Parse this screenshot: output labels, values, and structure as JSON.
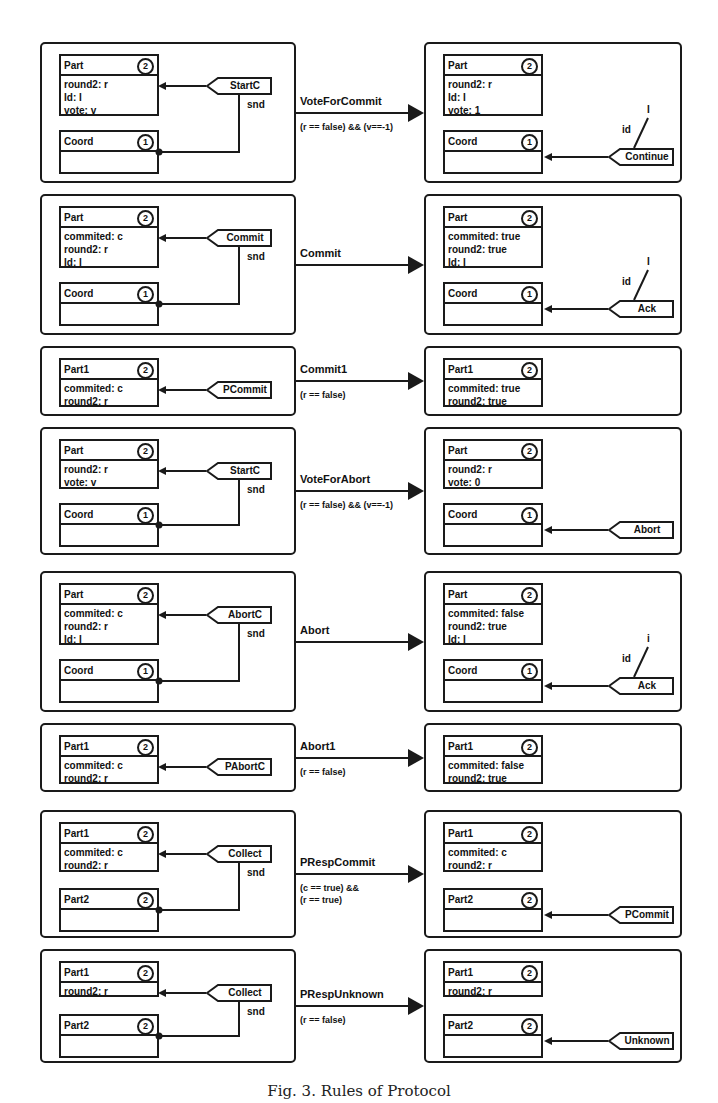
{
  "rules": [
    {
      "name": "VoteForCommit",
      "condition": [
        "(r == false) && (v==-1)"
      ],
      "lhs": {
        "nodes": [
          {
            "type": "Part",
            "mult": "2",
            "attrs": [
              "round2: r",
              "Id: I",
              "vote: v"
            ]
          },
          {
            "type": "Coord",
            "mult": "1",
            "attrs": []
          }
        ],
        "message": "StartC",
        "edge_label": "snd"
      },
      "rhs": {
        "nodes": [
          {
            "type": "Part",
            "mult": "2",
            "attrs": [
              "round2: r",
              "Id: I",
              "vote: 1"
            ]
          },
          {
            "type": "Coord",
            "mult": "1",
            "attrs": []
          }
        ],
        "message": "Continue",
        "param_label": "id",
        "param_value": "I"
      }
    },
    {
      "name": "Commit",
      "condition": [],
      "lhs": {
        "nodes": [
          {
            "type": "Part",
            "mult": "2",
            "attrs": [
              "commited: c",
              "round2: r",
              "Id: I"
            ]
          },
          {
            "type": "Coord",
            "mult": "1",
            "attrs": []
          }
        ],
        "message": "Commit",
        "edge_label": "snd"
      },
      "rhs": {
        "nodes": [
          {
            "type": "Part",
            "mult": "2",
            "attrs": [
              "commited: true",
              "round2: true",
              "Id: I"
            ]
          },
          {
            "type": "Coord",
            "mult": "1",
            "attrs": []
          }
        ],
        "message": "Ack",
        "param_label": "id",
        "param_value": "I"
      }
    },
    {
      "name": "Commit1",
      "condition": [
        "(r == false)"
      ],
      "lhs": {
        "nodes": [
          {
            "type": "Part1",
            "mult": "2",
            "attrs": [
              "commited: c",
              "round2: r"
            ]
          }
        ],
        "message": "PCommit"
      },
      "rhs": {
        "nodes": [
          {
            "type": "Part1",
            "mult": "2",
            "attrs": [
              "commited: true",
              "round2: true"
            ]
          }
        ]
      }
    },
    {
      "name": "VoteForAbort",
      "condition": [
        "(r == false) && (v==-1)"
      ],
      "lhs": {
        "nodes": [
          {
            "type": "Part",
            "mult": "2",
            "attrs": [
              "round2: r",
              "vote: v"
            ]
          },
          {
            "type": "Coord",
            "mult": "1",
            "attrs": []
          }
        ],
        "message": "StartC",
        "edge_label": "snd"
      },
      "rhs": {
        "nodes": [
          {
            "type": "Part",
            "mult": "2",
            "attrs": [
              "round2: r",
              "vote: 0"
            ]
          },
          {
            "type": "Coord",
            "mult": "1",
            "attrs": []
          }
        ],
        "message": "Abort"
      }
    },
    {
      "name": "Abort",
      "condition": [],
      "lhs": {
        "nodes": [
          {
            "type": "Part",
            "mult": "2",
            "attrs": [
              "commited: c",
              "round2: r",
              "Id: I"
            ]
          },
          {
            "type": "Coord",
            "mult": "1",
            "attrs": []
          }
        ],
        "message": "AbortC",
        "edge_label": "snd"
      },
      "rhs": {
        "nodes": [
          {
            "type": "Part",
            "mult": "2",
            "attrs": [
              "commited: false",
              "round2: true",
              "Id: I"
            ]
          },
          {
            "type": "Coord",
            "mult": "1",
            "attrs": []
          }
        ],
        "message": "Ack",
        "param_label": "id",
        "param_value": "i"
      }
    },
    {
      "name": "Abort1",
      "condition": [
        "(r == false)"
      ],
      "lhs": {
        "nodes": [
          {
            "type": "Part1",
            "mult": "2",
            "attrs": [
              "commited: c",
              "round2: r"
            ]
          }
        ],
        "message": "PAbortC"
      },
      "rhs": {
        "nodes": [
          {
            "type": "Part1",
            "mult": "2",
            "attrs": [
              "commited: false",
              "round2: true"
            ]
          }
        ]
      }
    },
    {
      "name": "PRespCommit",
      "condition": [
        "(c == true) &&",
        "(r == true)"
      ],
      "lhs": {
        "nodes": [
          {
            "type": "Part1",
            "mult": "2",
            "attrs": [
              "commited: c",
              "round2: r"
            ]
          },
          {
            "type": "Part2",
            "mult": "2",
            "attrs": []
          }
        ],
        "message": "Collect",
        "edge_label": "snd"
      },
      "rhs": {
        "nodes": [
          {
            "type": "Part1",
            "mult": "2",
            "attrs": [
              "commited: c",
              "round2: r"
            ]
          },
          {
            "type": "Part2",
            "mult": "2",
            "attrs": []
          }
        ],
        "message": "PCommit"
      }
    },
    {
      "name": "PRespUnknown",
      "condition": [
        "(r == false)"
      ],
      "lhs": {
        "nodes": [
          {
            "type": "Part1",
            "mult": "2",
            "attrs": [
              "round2: r"
            ]
          },
          {
            "type": "Part2",
            "mult": "2",
            "attrs": []
          }
        ],
        "message": "Collect",
        "edge_label": "snd"
      },
      "rhs": {
        "nodes": [
          {
            "type": "Part1",
            "mult": "2",
            "attrs": [
              "round2: r"
            ]
          },
          {
            "type": "Part2",
            "mult": "2",
            "attrs": []
          }
        ],
        "message": "Unknown"
      }
    }
  ],
  "caption": "Fig. 3. Rules of Protocol"
}
